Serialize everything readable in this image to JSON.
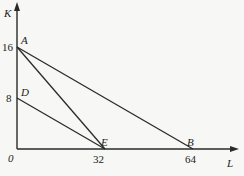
{
  "diagram": {
    "axes": {
      "x_label": "L",
      "y_label": "K",
      "origin_label": "0"
    },
    "ticks": {
      "y": [
        {
          "value": 16,
          "label": "16"
        },
        {
          "value": 8,
          "label": "8"
        }
      ],
      "x": [
        {
          "value": 32,
          "label": "32"
        },
        {
          "value": 64,
          "label": "64"
        }
      ]
    },
    "points": {
      "A": {
        "label": "A",
        "L": 0,
        "K": 16
      },
      "D": {
        "label": "D",
        "L": 0,
        "K": 8
      },
      "E": {
        "label": "E",
        "L": 32,
        "K": 0
      },
      "B": {
        "label": "B",
        "L": 64,
        "K": 0
      }
    },
    "segments": [
      {
        "name": "AB",
        "from": "A",
        "to": "B"
      },
      {
        "name": "AE",
        "from": "A",
        "to": "E"
      },
      {
        "name": "DE",
        "from": "D",
        "to": "E"
      }
    ]
  }
}
